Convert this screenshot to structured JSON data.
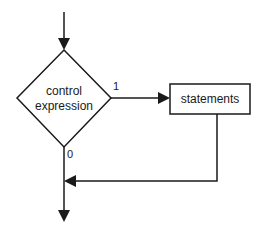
{
  "diagram": {
    "type": "flowchart",
    "decision": {
      "label_line1": "control",
      "label_line2": "expression"
    },
    "process": {
      "label": "statements"
    },
    "branches": {
      "true_label": "1",
      "false_label": "0"
    },
    "colors": {
      "stroke": "#1a1a1a",
      "background": "#ffffff"
    }
  }
}
